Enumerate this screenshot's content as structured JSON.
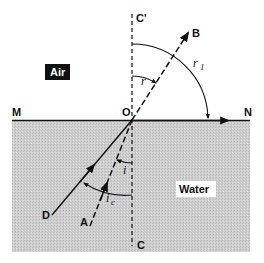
{
  "diagram": {
    "type": "refraction-total-internal-reflection",
    "media": {
      "upper": "Air",
      "lower": "Water"
    },
    "points": {
      "M": "M",
      "N": "N",
      "O": "O",
      "C_top": "C'",
      "C_bottom": "C",
      "A": "A",
      "B": "B",
      "D": "D"
    },
    "angles": {
      "refraction": "r",
      "refraction_limit": "r",
      "refraction_limit_sub": "1",
      "incidence": "i",
      "critical": "i",
      "critical_sub": "c"
    },
    "colors": {
      "water_fill": "#c9c9c9",
      "ink": "#111111",
      "air_label_bg": "#111111",
      "air_label_text": "#ffffff",
      "water_label_bg": "#ffffff"
    }
  }
}
